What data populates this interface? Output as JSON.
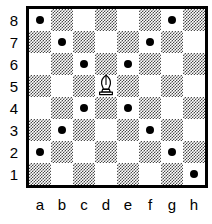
{
  "diagram": {
    "type": "chessboard",
    "orientation": "white",
    "files": [
      "a",
      "b",
      "c",
      "d",
      "e",
      "f",
      "g",
      "h"
    ],
    "ranks": [
      "8",
      "7",
      "6",
      "5",
      "4",
      "3",
      "2",
      "1"
    ],
    "colors": {
      "light_square": "#ffffff",
      "dark_square": "#4a4a4a",
      "border": "#000000",
      "marker": "#000000",
      "label": "#000000"
    },
    "pieces": [
      {
        "square": "d5",
        "piece": "bishop",
        "color": "white",
        "symbol": "♗"
      }
    ],
    "markers": [
      {
        "square": "a8",
        "kind": "move-dot"
      },
      {
        "square": "g8",
        "kind": "move-dot"
      },
      {
        "square": "b7",
        "kind": "move-dot"
      },
      {
        "square": "f7",
        "kind": "move-dot"
      },
      {
        "square": "c6",
        "kind": "move-dot"
      },
      {
        "square": "e6",
        "kind": "move-dot"
      },
      {
        "square": "c4",
        "kind": "move-dot"
      },
      {
        "square": "e4",
        "kind": "move-dot"
      },
      {
        "square": "b3",
        "kind": "move-dot"
      },
      {
        "square": "f3",
        "kind": "move-dot"
      },
      {
        "square": "a2",
        "kind": "move-dot"
      },
      {
        "square": "g2",
        "kind": "move-dot"
      },
      {
        "square": "h1",
        "kind": "move-dot"
      }
    ],
    "squares": [
      {
        "id": "a8",
        "shade": "light"
      },
      {
        "id": "b8",
        "shade": "dark"
      },
      {
        "id": "c8",
        "shade": "light"
      },
      {
        "id": "d8",
        "shade": "dark"
      },
      {
        "id": "e8",
        "shade": "light"
      },
      {
        "id": "f8",
        "shade": "dark"
      },
      {
        "id": "g8",
        "shade": "light"
      },
      {
        "id": "h8",
        "shade": "dark"
      },
      {
        "id": "a7",
        "shade": "dark"
      },
      {
        "id": "b7",
        "shade": "light"
      },
      {
        "id": "c7",
        "shade": "dark"
      },
      {
        "id": "d7",
        "shade": "light"
      },
      {
        "id": "e7",
        "shade": "dark"
      },
      {
        "id": "f7",
        "shade": "light"
      },
      {
        "id": "g7",
        "shade": "dark"
      },
      {
        "id": "h7",
        "shade": "light"
      },
      {
        "id": "a6",
        "shade": "light"
      },
      {
        "id": "b6",
        "shade": "dark"
      },
      {
        "id": "c6",
        "shade": "light"
      },
      {
        "id": "d6",
        "shade": "dark"
      },
      {
        "id": "e6",
        "shade": "light"
      },
      {
        "id": "f6",
        "shade": "dark"
      },
      {
        "id": "g6",
        "shade": "light"
      },
      {
        "id": "h6",
        "shade": "dark"
      },
      {
        "id": "a5",
        "shade": "dark"
      },
      {
        "id": "b5",
        "shade": "light"
      },
      {
        "id": "c5",
        "shade": "dark"
      },
      {
        "id": "d5",
        "shade": "light"
      },
      {
        "id": "e5",
        "shade": "dark"
      },
      {
        "id": "f5",
        "shade": "light"
      },
      {
        "id": "g5",
        "shade": "dark"
      },
      {
        "id": "h5",
        "shade": "light"
      },
      {
        "id": "a4",
        "shade": "light"
      },
      {
        "id": "b4",
        "shade": "dark"
      },
      {
        "id": "c4",
        "shade": "light"
      },
      {
        "id": "d4",
        "shade": "dark"
      },
      {
        "id": "e4",
        "shade": "light"
      },
      {
        "id": "f4",
        "shade": "dark"
      },
      {
        "id": "g4",
        "shade": "light"
      },
      {
        "id": "h4",
        "shade": "dark"
      },
      {
        "id": "a3",
        "shade": "dark"
      },
      {
        "id": "b3",
        "shade": "light"
      },
      {
        "id": "c3",
        "shade": "dark"
      },
      {
        "id": "d3",
        "shade": "light"
      },
      {
        "id": "e3",
        "shade": "dark"
      },
      {
        "id": "f3",
        "shade": "light"
      },
      {
        "id": "g3",
        "shade": "dark"
      },
      {
        "id": "h3",
        "shade": "light"
      },
      {
        "id": "a2",
        "shade": "light"
      },
      {
        "id": "b2",
        "shade": "dark"
      },
      {
        "id": "c2",
        "shade": "light"
      },
      {
        "id": "d2",
        "shade": "dark"
      },
      {
        "id": "e2",
        "shade": "light"
      },
      {
        "id": "f2",
        "shade": "dark"
      },
      {
        "id": "g2",
        "shade": "light"
      },
      {
        "id": "h2",
        "shade": "dark"
      },
      {
        "id": "a1",
        "shade": "dark"
      },
      {
        "id": "b1",
        "shade": "light"
      },
      {
        "id": "c1",
        "shade": "dark"
      },
      {
        "id": "d1",
        "shade": "light"
      },
      {
        "id": "e1",
        "shade": "dark"
      },
      {
        "id": "f1",
        "shade": "light"
      },
      {
        "id": "g1",
        "shade": "dark"
      },
      {
        "id": "h1",
        "shade": "light"
      }
    ]
  }
}
